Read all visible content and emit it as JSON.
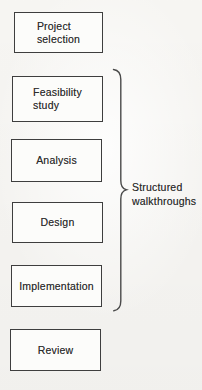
{
  "boxes": [
    {
      "lines": [
        "Project",
        "selection"
      ]
    },
    {
      "lines": [
        "Feasibility",
        "study"
      ]
    },
    {
      "lines": [
        "Analysis"
      ]
    },
    {
      "lines": [
        "Design"
      ]
    },
    {
      "lines": [
        "Implementation"
      ]
    },
    {
      "lines": [
        "Review"
      ]
    }
  ],
  "brace_label": {
    "line1": "Structured",
    "line2": "walkthroughs"
  },
  "colors": {
    "background": "#f7f6f3",
    "box-fill": "#fcfcfa",
    "box-border": "#3e3e3e",
    "text": "#2d2d2d",
    "brace": "#4a4a4a"
  }
}
